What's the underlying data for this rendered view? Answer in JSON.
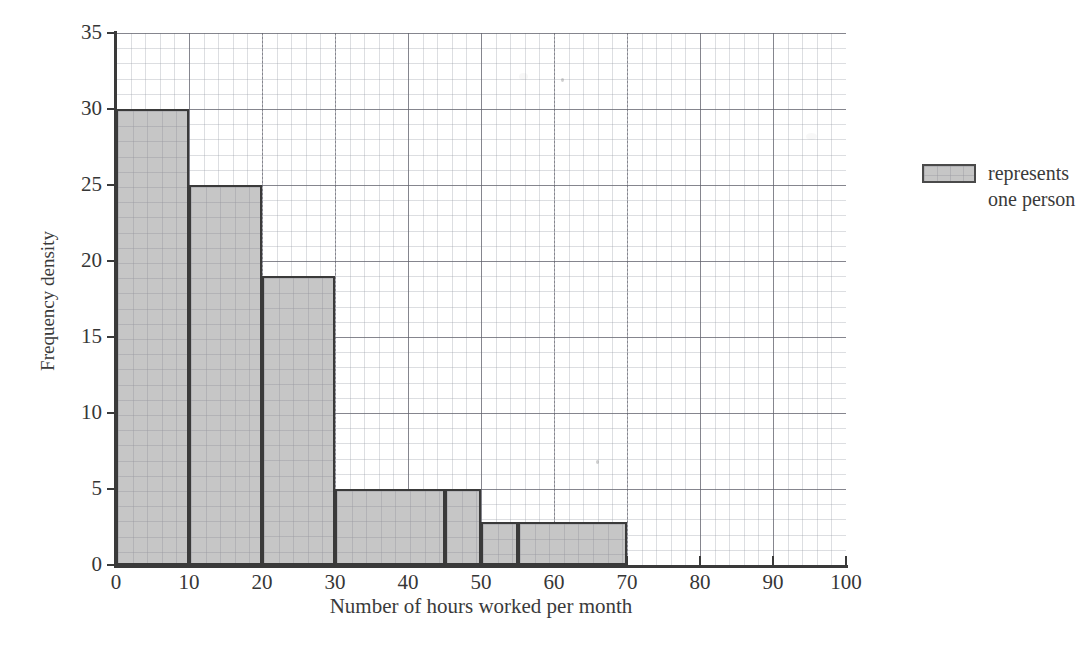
{
  "chart_data": {
    "type": "bar",
    "title": "",
    "subtitle": "",
    "xlabel": "Number of hours worked per month",
    "ylabel": "Frequency density",
    "xlim": [
      0,
      100
    ],
    "ylim": [
      0,
      35
    ],
    "grid": true,
    "grid_minor": true,
    "x_ticks": [
      0,
      10,
      20,
      30,
      40,
      50,
      60,
      70,
      80,
      90,
      100
    ],
    "y_ticks": [
      0,
      5,
      10,
      15,
      20,
      25,
      30,
      35
    ],
    "x_tick_labels": [
      "0",
      "10",
      "20",
      "30",
      "40",
      "50",
      "60",
      "70",
      "80",
      "90",
      "100"
    ],
    "y_tick_labels": [
      "0",
      "5",
      "10",
      "15",
      "20",
      "25",
      "30",
      "35"
    ],
    "bin_edges": [
      0,
      10,
      20,
      30,
      45,
      50,
      55,
      70
    ],
    "bars": [
      {
        "x_start": 0,
        "x_end": 10,
        "height": 30
      },
      {
        "x_start": 10,
        "x_end": 20,
        "height": 25
      },
      {
        "x_start": 20,
        "x_end": 30,
        "height": 19
      },
      {
        "x_start": 30,
        "x_end": 45,
        "height": 5
      },
      {
        "x_start": 45,
        "x_end": 50,
        "height": 5
      },
      {
        "x_start": 50,
        "x_end": 55,
        "height": 2.8
      },
      {
        "x_start": 55,
        "x_end": 70,
        "height": 2.8
      }
    ],
    "categories": [
      "0-10",
      "10-20",
      "20-30",
      "30-45",
      "45-50",
      "50-55",
      "55-70"
    ],
    "values": [
      30,
      25,
      19,
      5,
      5,
      2.8,
      2.8
    ],
    "legend": {
      "position": "right",
      "entries": [
        {
          "swatch": "shaded-grey-box",
          "line1": "represents",
          "line2": "one person"
        }
      ]
    },
    "colors": {
      "bar_fill": "#c6c6c6",
      "bar_edge": "#3a3a3a",
      "axis": "#3a3a3a",
      "grid_major": "#5a5a64",
      "grid_minor": "#969ba5",
      "text": "#3a3a3a",
      "background": "#ffffff"
    }
  }
}
